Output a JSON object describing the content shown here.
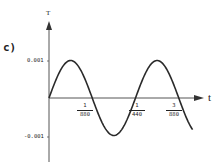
{
  "panel_label": "c)",
  "axes": {
    "y_name": "T",
    "x_name": "t",
    "y_ticks": [
      "0.001",
      "-0.001"
    ],
    "x_ticks": [
      {
        "num": "1",
        "den": "880"
      },
      {
        "num": "1",
        "den": "440"
      },
      {
        "num": "3",
        "den": "880"
      }
    ]
  },
  "chart_data": {
    "type": "line",
    "title": "",
    "panel": "c)",
    "xlabel": "t",
    "ylabel": "T",
    "series": [
      {
        "name": "T(t) = 0.001 sin(2π·440·t)",
        "x": [
          0,
          0.000568,
          0.001136,
          0.001705,
          0.002273,
          0.002841,
          0.003409,
          0.003977
        ],
        "y": [
          0,
          0.001,
          0,
          -0.001,
          0,
          0.001,
          0,
          -0.001
        ]
      }
    ],
    "x_tick_labels": [
      "1/880",
      "1/440",
      "3/880"
    ],
    "x_tick_values": [
      0.001136,
      0.002273,
      0.003409
    ],
    "y_tick_labels": [
      "0.001",
      "-0.001"
    ],
    "y_tick_values": [
      0.001,
      -0.001
    ],
    "amplitude": 0.001,
    "frequency_hz": 440,
    "ylim": [
      -0.0013,
      0.0013
    ],
    "grid": false,
    "legend": "none"
  }
}
